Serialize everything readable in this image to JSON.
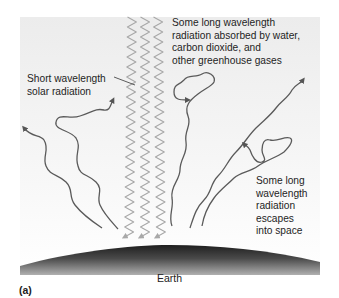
{
  "figure": {
    "panel_label": "(a)"
  },
  "labels": {
    "short_wavelength": "Short wavelength\nsolar radiation",
    "absorbed": "Some long wavelength\nradiation absorbed by water,\ncarbon dioxide, and\nother greenhouse gases",
    "escapes": "Some long\nwavelength\nradiation\nescapes\ninto space",
    "earth": "Earth"
  },
  "colors": {
    "background_panel": "#efefef",
    "short_wave": "#a8a8a8",
    "long_wave": "#5a5a5a",
    "earth_dark": "#2a2a2a",
    "earth_light": "#9a9a9a",
    "text": "#1e1e1e"
  },
  "elements": {
    "incoming_short_waves": 3,
    "outgoing_long_waves": 5
  }
}
